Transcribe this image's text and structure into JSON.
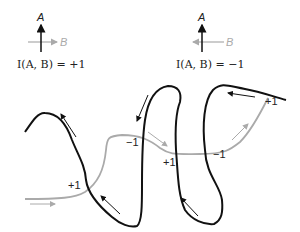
{
  "legend": {
    "positive": {
      "label_a": "A",
      "label_b": "B",
      "equation": "I(A, B) = +1"
    },
    "negative": {
      "label_a": "A",
      "label_b": "B",
      "equation": "I(A, B) = −1"
    }
  },
  "curves": {
    "curve_a": {
      "name": "A",
      "color": "#111111"
    },
    "curve_b": {
      "name": "B",
      "color": "#aaaaaa"
    }
  },
  "crossings": [
    {
      "label": "+1"
    },
    {
      "label": "−1"
    },
    {
      "label": "+1"
    },
    {
      "label": "−1"
    },
    {
      "label": "+1"
    }
  ]
}
